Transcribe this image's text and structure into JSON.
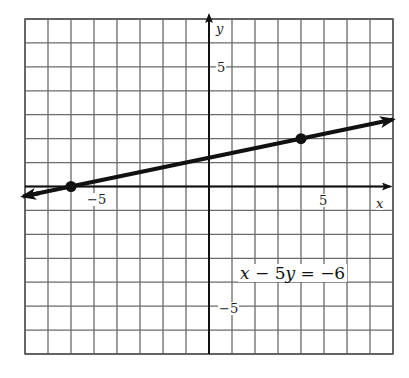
{
  "chart_data": {
    "type": "line",
    "title": "",
    "equation": "x − 5y = −6",
    "xlabel": "x",
    "ylabel": "y",
    "xlim": [
      -8,
      8
    ],
    "ylim": [
      -7,
      7
    ],
    "grid": true,
    "x_tick_labels": [
      {
        "value": -5,
        "label": "−5"
      },
      {
        "value": 5,
        "label": "5"
      }
    ],
    "y_tick_labels": [
      {
        "value": 5,
        "label": "5"
      },
      {
        "value": -5,
        "label": "−5"
      }
    ],
    "series": [
      {
        "name": "x − 5y = −6",
        "slope": 0.2,
        "intercept": 1.2,
        "x": [
          -8,
          8
        ],
        "y": [
          -0.4,
          2.8
        ],
        "arrows_both_ends": true
      }
    ],
    "points": [
      {
        "x": -6,
        "y": 0
      },
      {
        "x": 4,
        "y": 2
      }
    ]
  },
  "labels": {
    "x_axis": "x",
    "y_axis": "y",
    "x_neg5": "−5",
    "x_pos5": "5",
    "y_pos5": "5",
    "y_neg5": "−5",
    "eq_lhs_x": "x",
    "eq_minus": " − 5",
    "eq_y": "y",
    "eq_rhs": " = −6"
  }
}
